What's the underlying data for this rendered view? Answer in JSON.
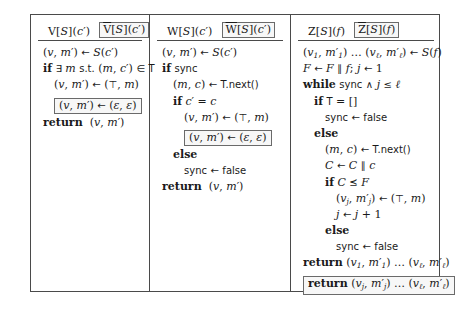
{
  "figure": {
    "columns": [
      {
        "id": "column-v",
        "header": {
          "plain": "V[S](c′)",
          "boxed": "V[S](c′)"
        },
        "lines": [
          {
            "indent": 0,
            "text": "(v, m′) ← S(c′)",
            "boxed": false
          },
          {
            "indent": 0,
            "text": "if ∃ m s.t. (m, c′) ∈ T",
            "boxed": false
          },
          {
            "indent": 1,
            "text": "(v, m′) ← (⊤, m)",
            "boxed": false
          },
          {
            "indent": 1,
            "text": "(v, m′) ← (ε, ε)",
            "boxed": true
          },
          {
            "indent": 0,
            "text": "return (v, m′)",
            "boxed": false
          }
        ]
      },
      {
        "id": "column-w",
        "header": {
          "plain": "W[S](c′)",
          "boxed": "W[S](c′)"
        },
        "lines": [
          {
            "indent": 0,
            "text": "(v, m′) ← S(c′)",
            "boxed": false
          },
          {
            "indent": 0,
            "text": "if sync",
            "boxed": false
          },
          {
            "indent": 1,
            "text": "(m, c) ← T.next()",
            "boxed": false
          },
          {
            "indent": 1,
            "text": "if c′ = c",
            "boxed": false
          },
          {
            "indent": 2,
            "text": "(v, m′) ← (⊤, m)",
            "boxed": false
          },
          {
            "indent": 2,
            "text": "(v, m′) ← (ε, ε)",
            "boxed": true
          },
          {
            "indent": 1,
            "text": "else",
            "boxed": false
          },
          {
            "indent": 2,
            "text": "sync ← false",
            "boxed": false
          },
          {
            "indent": 0,
            "text": "return (v, m′)",
            "boxed": false
          }
        ]
      },
      {
        "id": "column-z",
        "header": {
          "plain": "Z[S](f)",
          "boxed": "Z[S](f)"
        },
        "lines": [
          {
            "indent": 0,
            "text": "(v₁, m′₁) … (vℓ, m′ℓ) ← S(f)",
            "boxed": false
          },
          {
            "indent": 0,
            "text": "F ← F ‖ f; j ← 1",
            "boxed": false
          },
          {
            "indent": 0,
            "text": "while sync ∧ j ≤ ℓ",
            "boxed": false
          },
          {
            "indent": 1,
            "text": "if T = []",
            "boxed": false
          },
          {
            "indent": 2,
            "text": "sync ← false",
            "boxed": false
          },
          {
            "indent": 1,
            "text": "else",
            "boxed": false
          },
          {
            "indent": 2,
            "text": "(m, c) ← T.next()",
            "boxed": false
          },
          {
            "indent": 2,
            "text": "C ← C ‖ c",
            "boxed": false
          },
          {
            "indent": 2,
            "text": "if C ⪯ F",
            "boxed": false
          },
          {
            "indent": 3,
            "text": "(vⱼ, m′ⱼ) ← (⊤, m)",
            "boxed": false
          },
          {
            "indent": 3,
            "text": "j ← j + 1",
            "boxed": false
          },
          {
            "indent": 2,
            "text": "else",
            "boxed": false
          },
          {
            "indent": 3,
            "text": "sync ← false",
            "boxed": false
          },
          {
            "indent": 0,
            "text": "return (v₁, m′₁) … (vℓ, m′ℓ)",
            "boxed": false
          },
          {
            "indent": 0,
            "text": "return (vⱼ, m′ⱼ) … (vℓ, m′ℓ)",
            "boxed": true
          }
        ]
      }
    ]
  }
}
